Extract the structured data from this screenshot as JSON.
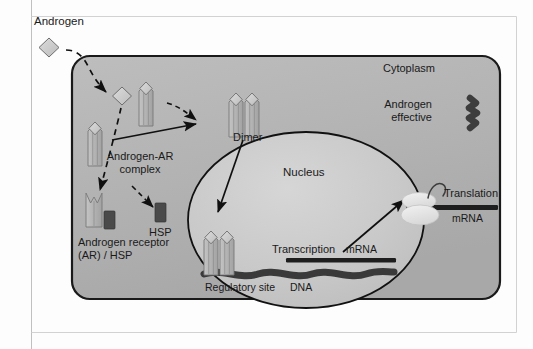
{
  "figure": {
    "background_color": "#fdfdfd",
    "frame_color": "#c8c8c8",
    "cell_fill": "#b3b3b3",
    "cell_border": "#1a1a1a",
    "nucleus_fill": "#c9c9c9",
    "nucleus_border": "#111111",
    "ligand_fill": "#cfcfcf",
    "ligand_border": "#6e6e6e",
    "receptor_fill": "#b8b8b8",
    "receptor_border": "#707070",
    "hsp_fill": "#4a4a4a",
    "dna_color": "#3a3a3a",
    "mrna_color": "#1e1e1e",
    "protein_color": "#3d3d3d",
    "ribosome_fill": "#e8e8e8",
    "arrow_color": "#101010"
  },
  "labels": {
    "androgen": "Androgen",
    "cytoplasm": "Cytoplasm",
    "dimer": "Dimer",
    "androgen_ar_complex_line1": "Androgen-AR",
    "androgen_ar_complex_line2": "complex",
    "hsp": "HSP",
    "androgen_receptor_line1": "Androgen receptor",
    "androgen_receptor_line2": "(AR) / HSP",
    "nucleus": "Nucleus",
    "regulatory_site": "Regulatory site",
    "transcription": "Transcription",
    "dna": "DNA",
    "mrna_nucleus": "mRNA",
    "translation": "Translation",
    "mrna_cytoplasm": "mRNA",
    "androgen_effective_line1": "Androgen",
    "androgen_effective_line2": "effective"
  },
  "elements": {
    "ligands": [
      {
        "name": "androgen-free-extracellular",
        "x": 49,
        "y": 47
      },
      {
        "name": "androgen-free-cytoplasmic",
        "x": 122,
        "y": 96
      }
    ],
    "receptors": [
      {
        "name": "androgen-ar-complex-upper",
        "x": 146,
        "y": 86
      },
      {
        "name": "androgen-ar-complex-lower",
        "x": 94,
        "y": 133
      },
      {
        "name": "dimer-left",
        "x": 236,
        "y": 100
      },
      {
        "name": "dimer-right",
        "x": 252,
        "y": 100
      },
      {
        "name": "bound-dimer-left",
        "x": 210,
        "y": 230
      },
      {
        "name": "bound-dimer-right",
        "x": 226,
        "y": 230
      }
    ],
    "unliganded_receptor": {
      "name": "androgen-receptor-hsp",
      "x": 94,
      "y": 209
    },
    "hsp_block": {
      "name": "hsp-chaperone",
      "x": 160,
      "y": 211
    },
    "ribosome": {
      "name": "ribosome",
      "x": 418,
      "y": 209
    },
    "protein_product": {
      "name": "effective-androgen-protein",
      "x": 470,
      "y": 110
    }
  },
  "arrows": [
    {
      "name": "arrow-androgen-entry",
      "style": "dashed"
    },
    {
      "name": "arrow-androgen-to-receptor",
      "style": "dashed"
    },
    {
      "name": "arrow-hsp-release",
      "style": "dashed"
    },
    {
      "name": "arrow-complex-to-dimer-upper",
      "style": "dashed"
    },
    {
      "name": "arrow-complex-to-dimer-lower",
      "style": "solid"
    },
    {
      "name": "arrow-dimer-to-nucleus",
      "style": "solid"
    },
    {
      "name": "arrow-mrna-export",
      "style": "solid"
    }
  ]
}
